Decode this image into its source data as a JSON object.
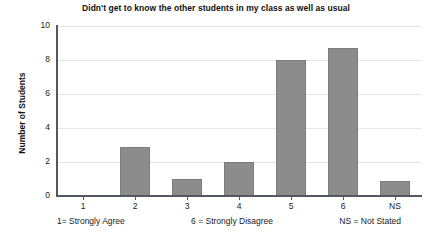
{
  "chart_data": {
    "type": "bar",
    "title": "Didn't get to know the other students in my class as well as usual",
    "xlabel": "",
    "ylabel": "Number of Students",
    "categories": [
      "1",
      "2",
      "3",
      "4",
      "5",
      "6",
      "NS"
    ],
    "values": [
      0,
      2.9,
      1,
      2,
      8,
      8.7,
      0.9
    ],
    "ylim": [
      0,
      10
    ],
    "yticks": [
      "0",
      "2",
      "4",
      "6",
      "8",
      "10"
    ],
    "ytick_values": [
      0,
      2,
      4,
      6,
      8,
      10
    ],
    "grid": true,
    "legend": "none",
    "bar_color": "#8c8c8c",
    "bar_edge_color": "#7c7c7c",
    "grid_color": "#e4e4e4",
    "axis_color": "#55585c",
    "background": "#ffffff",
    "annotations": [
      "1= Strongly Agree",
      "6 = Strongly Disagree",
      "NS = Not Stated"
    ]
  },
  "caption": {
    "key_low": "1= Strongly Agree",
    "key_high": "6 = Strongly Disagree",
    "key_ns": "NS = Not Stated"
  }
}
